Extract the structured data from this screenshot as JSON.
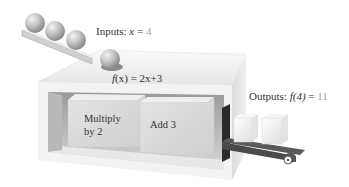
{
  "inputs": {
    "label": "Inputs:",
    "variable": "x",
    "equals": " = ",
    "value": "4"
  },
  "function": {
    "name": "f",
    "arg": "(x)",
    "equals": " = ",
    "expression": "2x+3"
  },
  "steps": [
    {
      "line1": "Multiply",
      "line2": "by 2"
    },
    {
      "line1": "Add 3",
      "line2": ""
    }
  ],
  "outputs": {
    "label": "Outputs:",
    "function_call": "f(4)",
    "equals": " = ",
    "value": "11"
  },
  "colors": {
    "value_accent": "#8fa6a6",
    "text": "#333333"
  }
}
